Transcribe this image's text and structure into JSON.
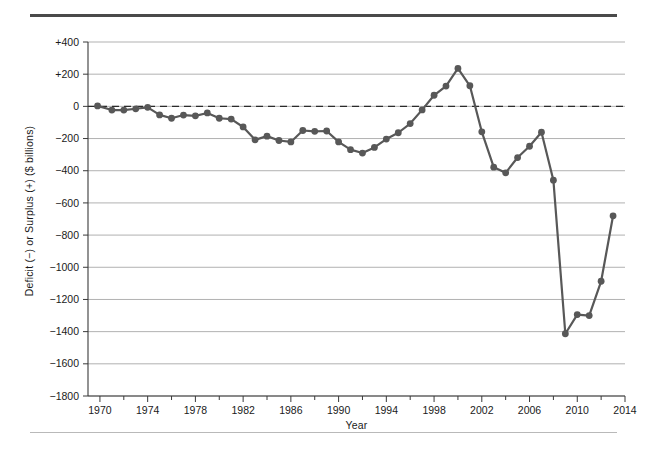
{
  "figure": {
    "background_color": "#ffffff",
    "rule_top_color": "#4a4a4a",
    "rule_bottom_color": "#b9b9b9"
  },
  "chart_data": {
    "type": "line",
    "title": "",
    "subtitle": "",
    "xlabel": "Year",
    "ylabel": "Deficit (−) or Surplus (+) ($ billions)",
    "xlim": [
      1969,
      2014
    ],
    "ylim": [
      -1800,
      400
    ],
    "x_major_ticks": [
      1970,
      1974,
      1978,
      1982,
      1986,
      1990,
      1994,
      1998,
      2002,
      2006,
      2010,
      2014
    ],
    "x_minor_tick_step": 2,
    "x_tick_labels": [
      "1970",
      "1974",
      "1978",
      "1982",
      "1986",
      "1990",
      "1994",
      "1998",
      "2002",
      "2006",
      "2010",
      "2014"
    ],
    "y_ticks": [
      400,
      200,
      0,
      -200,
      -400,
      -600,
      -800,
      -1000,
      -1200,
      -1400,
      -1600,
      -1800
    ],
    "y_tick_labels": [
      "+400",
      "+200",
      "0",
      "−200",
      "−400",
      "−600",
      "−800",
      "−1000",
      "−1200",
      "−1400",
      "−1600",
      "−1800"
    ],
    "grid": true,
    "grid_axis": "y",
    "grid_color": "#a8a8a8",
    "legend": false,
    "legend_position": "none",
    "zero_reference_line": {
      "value": 0,
      "style": "dashed",
      "color": "#2b2b2b"
    },
    "series_color": "#585858",
    "marker": "circle",
    "marker_size": 6,
    "x": [
      1969.8,
      1971,
      1972,
      1973,
      1974,
      1975,
      1976,
      1977,
      1978,
      1979,
      1980,
      1981,
      1982,
      1983,
      1984,
      1985,
      1986,
      1987,
      1988,
      1989,
      1990,
      1991,
      1992,
      1993,
      1994,
      1995,
      1996,
      1997,
      1998,
      1999,
      2000,
      2001,
      2002,
      2003,
      2004,
      2005,
      2006,
      2007,
      2008,
      2009,
      2010,
      2011,
      2012,
      2013
    ],
    "values": [
      3,
      -23,
      -23,
      -15,
      -6,
      -53,
      -74,
      -54,
      -59,
      -41,
      -74,
      -79,
      -128,
      -208,
      -185,
      -212,
      -221,
      -150,
      -155,
      -153,
      -221,
      -269,
      -290,
      -255,
      -203,
      -164,
      -107,
      -22,
      69,
      126,
      236,
      128,
      -158,
      -378,
      -413,
      -318,
      -248,
      -161,
      -459,
      -1413,
      -1294,
      -1300,
      -1087,
      -680
    ],
    "points": [
      {
        "year": 1970,
        "value": 3
      },
      {
        "year": 1971,
        "value": -23
      },
      {
        "year": 1972,
        "value": -23
      },
      {
        "year": 1973,
        "value": -15
      },
      {
        "year": 1974,
        "value": -6
      },
      {
        "year": 1975,
        "value": -53
      },
      {
        "year": 1976,
        "value": -74
      },
      {
        "year": 1977,
        "value": -54
      },
      {
        "year": 1978,
        "value": -59
      },
      {
        "year": 1979,
        "value": -41
      },
      {
        "year": 1980,
        "value": -74
      },
      {
        "year": 1981,
        "value": -79
      },
      {
        "year": 1982,
        "value": -128
      },
      {
        "year": 1983,
        "value": -208
      },
      {
        "year": 1984,
        "value": -185
      },
      {
        "year": 1985,
        "value": -212
      },
      {
        "year": 1986,
        "value": -221
      },
      {
        "year": 1987,
        "value": -150
      },
      {
        "year": 1988,
        "value": -155
      },
      {
        "year": 1989,
        "value": -153
      },
      {
        "year": 1990,
        "value": -221
      },
      {
        "year": 1991,
        "value": -269
      },
      {
        "year": 1992,
        "value": -290
      },
      {
        "year": 1993,
        "value": -255
      },
      {
        "year": 1994,
        "value": -203
      },
      {
        "year": 1995,
        "value": -164
      },
      {
        "year": 1996,
        "value": -107
      },
      {
        "year": 1997,
        "value": -22
      },
      {
        "year": 1998,
        "value": 69
      },
      {
        "year": 1999,
        "value": 126
      },
      {
        "year": 2000,
        "value": 236
      },
      {
        "year": 2001,
        "value": 128
      },
      {
        "year": 2002,
        "value": -158
      },
      {
        "year": 2003,
        "value": -378
      },
      {
        "year": 2004,
        "value": -413
      },
      {
        "year": 2005,
        "value": -318
      },
      {
        "year": 2006,
        "value": -248
      },
      {
        "year": 2007,
        "value": -161
      },
      {
        "year": 2008,
        "value": -459
      },
      {
        "year": 2009,
        "value": -1413
      },
      {
        "year": 2010,
        "value": -1294
      },
      {
        "year": 2011,
        "value": -1300
      },
      {
        "year": 2012,
        "value": -1087
      },
      {
        "year": 2013,
        "value": -680
      }
    ]
  }
}
